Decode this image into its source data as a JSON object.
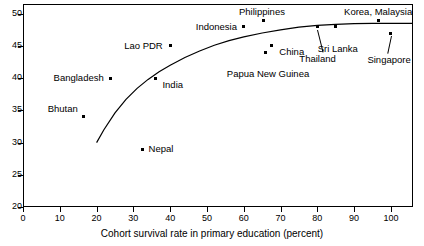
{
  "chart_data": {
    "type": "scatter",
    "title": "",
    "xlabel": "Cohort survival rate in primary education (percent)",
    "ylabel": "",
    "xlim": [
      0,
      106
    ],
    "ylim": [
      20,
      51.5
    ],
    "xticks": [
      0,
      10,
      20,
      30,
      40,
      50,
      60,
      70,
      80,
      90,
      100
    ],
    "yticks": [
      20,
      25,
      30,
      35,
      40,
      45,
      50
    ],
    "grid": false,
    "legend": "none",
    "points": [
      {
        "name": "Bhutan",
        "x": 16.5,
        "y": 34.0,
        "label_dx": -6,
        "label_dy": -13,
        "label_anchor": "end",
        "leader": false
      },
      {
        "name": "Bangladesh",
        "x": 23.8,
        "y": 40.0,
        "label_dx": -7,
        "label_dy": -5,
        "label_anchor": "end",
        "leader": false
      },
      {
        "name": "Nepal",
        "x": 32.5,
        "y": 29.0,
        "label_dx": 6,
        "label_dy": -5,
        "label_anchor": "start",
        "leader": false
      },
      {
        "name": "India",
        "x": 36.0,
        "y": 40.0,
        "label_dx": 7,
        "label_dy": 2,
        "label_anchor": "start",
        "leader": false
      },
      {
        "name": "Lao PDR",
        "x": 40.0,
        "y": 45.0,
        "label_dx": -7,
        "label_dy": -5,
        "label_anchor": "end",
        "leader": false
      },
      {
        "name": "Indonesia",
        "x": 60.0,
        "y": 48.0,
        "label_dx": -7,
        "label_dy": -5,
        "label_anchor": "end",
        "leader": false
      },
      {
        "name": "Philippines",
        "x": 65.5,
        "y": 49.0,
        "label_dx": -2,
        "label_dy": -13,
        "label_anchor": "middle",
        "leader": false
      },
      {
        "name": "Papua New Guinea",
        "x": 66.0,
        "y": 44.0,
        "label_dx": 2,
        "label_dy": 17,
        "label_anchor": "middle",
        "leader": false
      },
      {
        "name": "China",
        "x": 67.5,
        "y": 45.0,
        "label_dx": 8,
        "label_dy": 1,
        "label_anchor": "start",
        "leader": false
      },
      {
        "name": "Thailand",
        "x": 80.0,
        "y": 48.0,
        "label_dx": 0,
        "label_dy": 27,
        "label_anchor": "middle",
        "leader": true
      },
      {
        "name": "Sri Lanka",
        "x": 85.0,
        "y": 48.0,
        "label_dx": 2,
        "label_dy": 17,
        "label_anchor": "middle",
        "leader": false
      },
      {
        "name": "Korea, Malaysia",
        "x": 96.5,
        "y": 49.0,
        "label_dx": 0,
        "label_dy": -13,
        "label_anchor": "middle",
        "leader": false
      },
      {
        "name": "Singapore",
        "x": 100.0,
        "y": 47.0,
        "label_dx": -2,
        "label_dy": 22,
        "label_anchor": "middle",
        "leader": true
      }
    ],
    "trend_curve": {
      "description": "fitted logarithmic trend line rising from (20,30) and flattening near 48.5",
      "x": [
        20,
        22,
        25,
        28,
        31,
        34,
        37,
        40,
        44,
        48,
        52,
        56,
        60,
        65,
        70,
        75,
        80,
        85,
        90,
        95,
        100,
        106
      ],
      "y": [
        30.0,
        32.0,
        34.6,
        36.7,
        38.4,
        39.8,
        41.0,
        42.0,
        43.2,
        44.2,
        45.1,
        45.8,
        46.4,
        47.0,
        47.5,
        47.9,
        48.2,
        48.35,
        48.45,
        48.5,
        48.5,
        48.5
      ]
    }
  },
  "colors": {
    "axis": "#000000",
    "point": "#000000",
    "curve": "#000000",
    "background": "#ffffff"
  }
}
